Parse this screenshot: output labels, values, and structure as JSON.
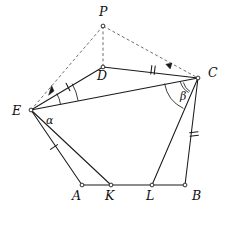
{
  "figure": {
    "background_color": "#ffffff",
    "line_color": "#1a1a1a",
    "dashed_color": "#6f6f6f"
  },
  "points": [
    {
      "id": "P",
      "label": "P",
      "x": 103,
      "y": 26,
      "label_x": 99,
      "label_y": 16,
      "marker": true
    },
    {
      "id": "D",
      "label": "D",
      "x": 103,
      "y": 67,
      "label_x": 97,
      "label_y": 80,
      "marker": true
    },
    {
      "id": "C",
      "label": "C",
      "x": 198,
      "y": 78,
      "label_x": 208,
      "label_y": 77,
      "marker": true
    },
    {
      "id": "E",
      "label": "E",
      "x": 31,
      "y": 110,
      "label_x": 12,
      "label_y": 115,
      "marker": true
    },
    {
      "id": "A",
      "label": "A",
      "x": 82,
      "y": 185,
      "label_x": 72,
      "label_y": 200,
      "marker": true
    },
    {
      "id": "K",
      "label": "K",
      "x": 111,
      "y": 185,
      "label_x": 105,
      "label_y": 200,
      "marker": true
    },
    {
      "id": "L",
      "label": "L",
      "x": 152,
      "y": 185,
      "label_x": 146,
      "label_y": 200,
      "marker": true
    },
    {
      "id": "B",
      "label": "B",
      "x": 185,
      "y": 185,
      "label_x": 192,
      "label_y": 200,
      "marker": true
    }
  ],
  "solid_edges": [
    {
      "name": "edge-E-D",
      "from": "E",
      "to": "D"
    },
    {
      "name": "edge-D-C",
      "from": "D",
      "to": "C"
    },
    {
      "name": "edge-E-C",
      "from": "E",
      "to": "C"
    },
    {
      "name": "edge-E-A",
      "from": "E",
      "to": "A"
    },
    {
      "name": "edge-E-K",
      "from": "E",
      "to": "K"
    },
    {
      "name": "edge-C-L",
      "from": "C",
      "to": "L"
    },
    {
      "name": "edge-C-B",
      "from": "C",
      "to": "B"
    },
    {
      "name": "edge-A-B",
      "from": "A",
      "to": "B"
    }
  ],
  "dashed_edges": [
    {
      "name": "edge-P-E",
      "from": "P",
      "to": "E"
    },
    {
      "name": "edge-P-C",
      "from": "P",
      "to": "C"
    },
    {
      "name": "edge-P-D",
      "from": "P",
      "to": "D"
    }
  ],
  "tick_marks": [
    {
      "name": "tick-ED",
      "on": "E-D",
      "count": 1,
      "x": 68,
      "y": 87,
      "angle": -27
    },
    {
      "name": "tick-DC",
      "on": "D-C",
      "count": 2,
      "x": 153,
      "y": 70,
      "angle": 7
    },
    {
      "name": "tick-EA",
      "on": "E-A",
      "count": 1,
      "x": 54,
      "y": 147,
      "angle": 56
    },
    {
      "name": "tick-CB",
      "on": "C-B",
      "count": 2,
      "x": 194,
      "y": 134,
      "angle": 83
    }
  ],
  "angle_marks": [
    {
      "name": "angle-alpha",
      "label": "α",
      "vertex": "E",
      "radius": 30,
      "label_x": 46,
      "label_y": 124
    },
    {
      "name": "angle-beta",
      "label": "β",
      "vertex": "C",
      "radius": 34,
      "label_x": 180,
      "label_y": 100
    }
  ],
  "angle_arcs_extra": [
    {
      "name": "arc-E-outer",
      "vertex": "E",
      "radius": 48
    },
    {
      "name": "arc-C-small-1",
      "vertex": "C",
      "radius": 15
    },
    {
      "name": "arc-C-small-2",
      "vertex": "C",
      "radius": 18
    }
  ],
  "arrow_heads": [
    {
      "name": "arrowhead-E-arc",
      "x": 54,
      "y": 91,
      "angle": -30
    },
    {
      "name": "arrowhead-C-arc",
      "x": 172,
      "y": 63,
      "angle": 22
    }
  ]
}
